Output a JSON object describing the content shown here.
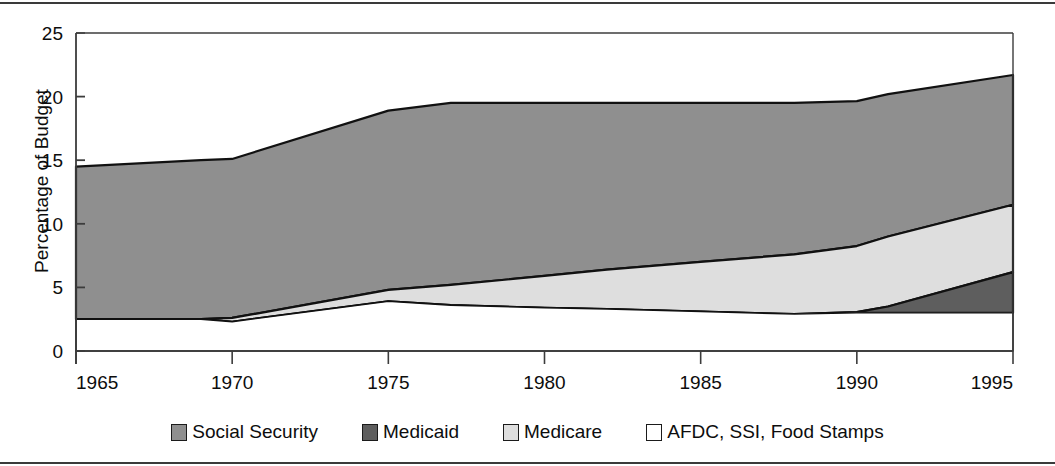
{
  "chart_data": {
    "type": "area",
    "title": "",
    "subtitle": "",
    "xlabel": "",
    "ylabel": "Percentage of Budget",
    "stacked": true,
    "grid": false,
    "legend_position": "bottom",
    "xlim": [
      1965,
      1995
    ],
    "ylim": [
      0,
      25
    ],
    "xticks": [
      1965,
      1970,
      1975,
      1980,
      1985,
      1990,
      1995
    ],
    "xtick_labels": [
      "1965",
      "1970",
      "1975",
      "1980",
      "1985",
      "1990",
      "1995"
    ],
    "yticks": [
      0,
      5,
      10,
      15,
      20,
      25
    ],
    "ytick_labels": [
      "0",
      "5",
      "10",
      "15",
      "20",
      "25"
    ],
    "x": [
      1965,
      1969,
      1970,
      1975,
      1977,
      1980,
      1982,
      1985,
      1988,
      1990,
      1991,
      1995
    ],
    "series": [
      {
        "name": "AFDC, SSI, Food Stamps",
        "color": "#ffffff",
        "values": [
          2.5,
          2.5,
          2.3,
          3.9,
          3.6,
          3.4,
          3.3,
          3.1,
          2.9,
          3.0,
          3.0,
          3.0
        ]
      },
      {
        "name": "Medicaid",
        "color": "#5e5e5e",
        "values": [
          0.0,
          0.0,
          0.0,
          0.0,
          0.0,
          0.0,
          0.0,
          0.0,
          0.0,
          0.05,
          0.5,
          3.2
        ]
      },
      {
        "name": "Medicare",
        "color": "#dedede",
        "values": [
          0.0,
          0.0,
          0.3,
          0.9,
          1.6,
          2.5,
          3.1,
          3.9,
          4.7,
          5.2,
          5.5,
          5.3
        ]
      },
      {
        "name": "Social Security",
        "color": "#8f8f8f",
        "values": [
          12.0,
          12.5,
          12.5,
          14.1,
          14.3,
          13.6,
          13.1,
          12.5,
          11.9,
          11.4,
          11.2,
          10.2
        ]
      }
    ],
    "stack_tops": {
      "afdc_ssi_food_stamps": [
        2.5,
        2.5,
        2.3,
        3.9,
        3.6,
        3.4,
        3.3,
        3.1,
        2.9,
        3.0,
        3.0,
        3.0
      ],
      "medicaid": [
        2.5,
        2.5,
        2.3,
        3.9,
        3.6,
        3.4,
        3.3,
        3.1,
        2.9,
        3.05,
        3.5,
        6.2
      ],
      "medicare": [
        2.5,
        2.5,
        2.6,
        4.8,
        5.2,
        5.9,
        6.4,
        7.0,
        7.6,
        8.25,
        9.0,
        11.5
      ],
      "social_security": [
        14.5,
        15.0,
        15.1,
        18.9,
        19.5,
        19.5,
        19.5,
        19.5,
        19.5,
        19.65,
        20.2,
        21.7
      ]
    },
    "annotations": []
  },
  "legend": {
    "items": [
      {
        "label": "Social Security",
        "color": "#8f8f8f"
      },
      {
        "label": "Medicaid",
        "color": "#5e5e5e"
      },
      {
        "label": "Medicare",
        "color": "#dedede"
      },
      {
        "label": "AFDC, SSI, Food Stamps",
        "color": "#ffffff"
      }
    ]
  },
  "axis": {
    "y_title": "Percentage of Budget"
  }
}
